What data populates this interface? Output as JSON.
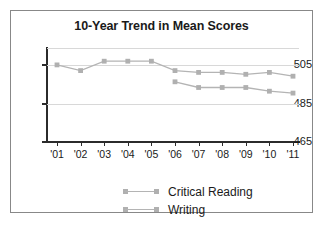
{
  "chart_data": {
    "type": "line",
    "title": "10-Year Trend in Mean Scores",
    "xlabel": "",
    "ylabel": "",
    "categories": [
      "'01",
      "'02",
      "'03",
      "'04",
      "'05",
      "'06",
      "'07",
      "'08",
      "'09",
      "'10",
      "'11"
    ],
    "ylim": [
      465,
      515
    ],
    "yticks": [
      465,
      485,
      505
    ],
    "ytick_labels": [
      "465",
      "485",
      "505"
    ],
    "grid": true,
    "legend_position": "bottom",
    "series": [
      {
        "name": "Critical Reading",
        "color": "#b0b0b0",
        "values": [
          506,
          503,
          508,
          508,
          508,
          503,
          502,
          502,
          501,
          502,
          500
        ]
      },
      {
        "name": "Writing",
        "color": "#b0b0b0",
        "values": [
          null,
          null,
          null,
          null,
          null,
          497,
          494,
          494,
          494,
          492,
          491
        ]
      }
    ]
  },
  "legend": {
    "items": [
      {
        "label": "Critical Reading"
      },
      {
        "label": "Writing"
      }
    ]
  },
  "colors": {
    "series": "#b0b0b0",
    "line": "#b4b4b4",
    "axis": "#2b2b2b",
    "grid": "#d8d8d8",
    "border": "#888888",
    "text": "#1a1a1a"
  }
}
